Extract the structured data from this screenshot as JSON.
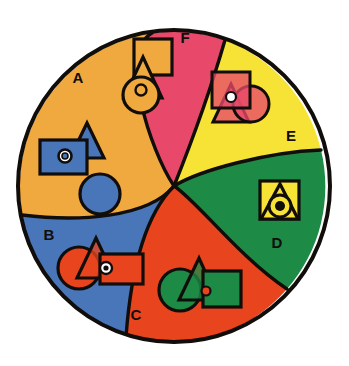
{
  "figure": {
    "type": "diagram",
    "canvas": {
      "width": 349,
      "height": 366,
      "background": "#ffffff"
    },
    "circle": {
      "cx": 174,
      "cy": 186,
      "r": 158,
      "outline": "#110d0b",
      "outline_width": 4
    }
  },
  "palette": {
    "orange": "#F0A93E",
    "crimson": "#E8496A",
    "yellow": "#F7E236",
    "green": "#1D8A46",
    "red": "#E8441E",
    "blue": "#4876B8",
    "outline": "#110d0b",
    "white": "#ffffff"
  },
  "sectors": [
    {
      "id": "A",
      "label": "A",
      "fill_color": "#F0A93E",
      "fill_name": "orange",
      "shape_color": "#4876B8",
      "shape_color_name": "blue",
      "label_x": 78,
      "label_y": 83
    },
    {
      "id": "B",
      "label": "B",
      "fill_color": "#4876B8",
      "fill_name": "blue",
      "shape_color": "#E8441E",
      "shape_color_name": "red",
      "label_x": 49,
      "label_y": 240
    },
    {
      "id": "C",
      "label": "C",
      "fill_color": "#E8441E",
      "fill_name": "red",
      "shape_color": "#1D8A46",
      "shape_color_name": "green",
      "label_x": 136,
      "label_y": 320
    },
    {
      "id": "D",
      "label": "D",
      "fill_color": "#1D8A46",
      "fill_name": "green",
      "shape_color": "#F7E236",
      "shape_color_name": "yellow",
      "label_x": 277,
      "label_y": 248
    },
    {
      "id": "E",
      "label": "E",
      "fill_color": "#F7E236",
      "fill_name": "yellow",
      "shape_color": "#E8496A",
      "shape_color_name": "crimson",
      "label_x": 291,
      "label_y": 141
    },
    {
      "id": "F",
      "label": "F",
      "fill_color": "#E8496A",
      "fill_name": "crimson",
      "shape_color": "#F0A93E",
      "shape_color_name": "orange",
      "label_x": 185,
      "label_y": 43
    }
  ],
  "shape_groups": [
    {
      "sector": "A",
      "shapes": [
        "triangle",
        "square",
        "small-circle",
        "circle"
      ],
      "description": "blue triangle overlapped by blue rectangle containing small circle, plus separate blue circle below"
    },
    {
      "sector": "B",
      "shapes": [
        "circle",
        "triangle",
        "square",
        "small-circle"
      ],
      "description": "red circle, red triangle and red rectangle with small circle, overlapping in a row"
    },
    {
      "sector": "C",
      "shapes": [
        "circle",
        "triangle",
        "square",
        "small-circle"
      ],
      "description": "green circle, green triangle and green square with small circle, overlapping in a row"
    },
    {
      "sector": "D",
      "shapes": [
        "square",
        "triangle",
        "circle",
        "small-circle"
      ],
      "description": "yellow square with yellow triangle and concentric circles, all stacked on one center"
    },
    {
      "sector": "E",
      "shapes": [
        "square",
        "triangle",
        "circle",
        "small-circle"
      ],
      "description": "crimson square, crimson triangle and crimson circle overlapping translucently"
    },
    {
      "sector": "F",
      "shapes": [
        "square",
        "triangle",
        "circle",
        "small-circle"
      ],
      "description": "orange square, orange triangle and orange circle with small circle, stacked vertically"
    }
  ]
}
